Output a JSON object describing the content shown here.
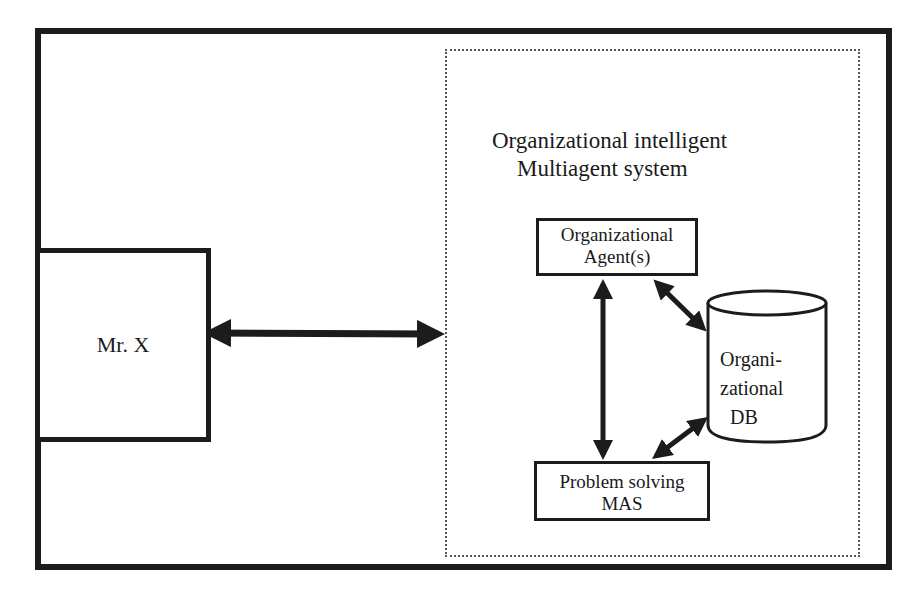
{
  "diagram": {
    "user_node": {
      "label": "Mr. X"
    },
    "system": {
      "title_line1": "Organizational intelligent",
      "title_line2": "Multiagent system",
      "agent_box": {
        "line1": "Organizational",
        "line2": "Agent(s)"
      },
      "mas_box": {
        "line1": "Problem solving",
        "line2": "MAS"
      },
      "database": {
        "line1": "Organi-",
        "line2": "zational",
        "line3": "DB"
      }
    },
    "connections": [
      {
        "from": "Mr. X",
        "to": "Organizational intelligent Multiagent system",
        "type": "bidirectional"
      },
      {
        "from": "Organizational Agent(s)",
        "to": "Problem solving MAS",
        "type": "bidirectional"
      },
      {
        "from": "Organizational Agent(s)",
        "to": "Organizational DB",
        "type": "bidirectional"
      },
      {
        "from": "Problem solving MAS",
        "to": "Organizational DB",
        "type": "bidirectional"
      }
    ]
  }
}
